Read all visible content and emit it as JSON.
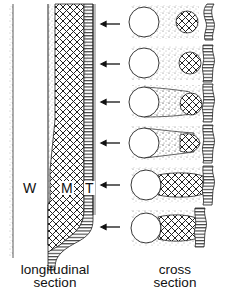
{
  "labels": {
    "w": "W",
    "m": "M",
    "t": "T"
  },
  "captions": {
    "left_line1": "longitudinal",
    "left_line2": "section",
    "right_line1": "cross",
    "right_line2": "section"
  },
  "colors": {
    "ink": "#111111",
    "background": "#ffffff",
    "stipple": "#555555"
  },
  "cross_sections_count": 6,
  "arrows_count": 6
}
